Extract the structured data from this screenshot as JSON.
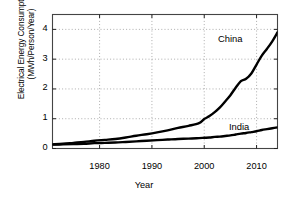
{
  "chart_data": {
    "type": "line",
    "title": "",
    "xlabel": "Year",
    "ylabel_line1": "Electrical Energy Consumption",
    "ylabel_line2": "(MWh/Person/Year)",
    "xlim": [
      1971,
      2014
    ],
    "ylim": [
      0,
      4.5
    ],
    "xticks": [
      1980,
      1990,
      2000,
      2010
    ],
    "xticklabels": [
      "1980",
      "1990",
      "2000",
      "2010"
    ],
    "yticks": [
      0,
      1,
      2,
      3,
      4
    ],
    "yticklabels": [
      "0",
      "1",
      "2",
      "3",
      "4"
    ],
    "grid": true,
    "grid_style": "dotted",
    "legend_position": "inline-annotations",
    "line_color": "#000000",
    "line_width": 2.4,
    "x": [
      1971,
      1973,
      1975,
      1977,
      1979,
      1981,
      1983,
      1985,
      1987,
      1989,
      1991,
      1993,
      1995,
      1997,
      1999,
      2000,
      2001,
      2002,
      2003,
      2004,
      2005,
      2006,
      2007,
      2008,
      2009,
      2010,
      2011,
      2012,
      2013,
      2014
    ],
    "series": [
      {
        "name": "China",
        "label": "China",
        "values": [
          0.14,
          0.16,
          0.19,
          0.22,
          0.26,
          0.29,
          0.32,
          0.37,
          0.43,
          0.48,
          0.54,
          0.61,
          0.69,
          0.76,
          0.85,
          0.99,
          1.09,
          1.22,
          1.38,
          1.58,
          1.79,
          2.04,
          2.26,
          2.34,
          2.52,
          2.82,
          3.12,
          3.35,
          3.6,
          3.9
        ]
      },
      {
        "name": "India",
        "label": "India",
        "values": [
          0.13,
          0.14,
          0.15,
          0.16,
          0.18,
          0.19,
          0.2,
          0.22,
          0.24,
          0.26,
          0.28,
          0.3,
          0.32,
          0.33,
          0.35,
          0.36,
          0.37,
          0.39,
          0.4,
          0.42,
          0.44,
          0.47,
          0.5,
          0.52,
          0.55,
          0.58,
          0.62,
          0.65,
          0.68,
          0.71
        ]
      }
    ]
  }
}
